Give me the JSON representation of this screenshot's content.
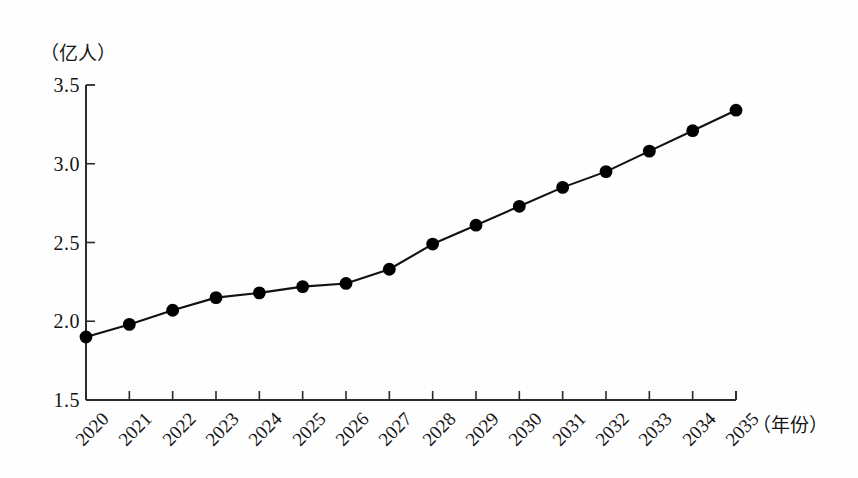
{
  "chart_data": {
    "type": "line",
    "title": "",
    "xlabel": "（年份）",
    "ylabel": "（亿人）",
    "categories": [
      "2020",
      "2021",
      "2022",
      "2023",
      "2024",
      "2025",
      "2026",
      "2027",
      "2028",
      "2029",
      "2030",
      "2031",
      "2032",
      "2033",
      "2034",
      "2035"
    ],
    "values": [
      1.9,
      1.98,
      2.07,
      2.15,
      2.18,
      2.22,
      2.24,
      2.33,
      2.49,
      2.61,
      2.73,
      2.85,
      2.95,
      3.08,
      3.21,
      3.34
    ],
    "series": [
      {
        "name": "人口",
        "values": [
          1.9,
          1.98,
          2.07,
          2.15,
          2.18,
          2.22,
          2.24,
          2.33,
          2.49,
          2.61,
          2.73,
          2.85,
          2.95,
          3.08,
          3.21,
          3.34
        ]
      }
    ],
    "ylim": [
      1.5,
      3.5
    ],
    "yticks": [
      1.5,
      2.0,
      2.5,
      3.0,
      3.5
    ],
    "ytick_labels": [
      "1.5",
      "2.0",
      "2.5",
      "3.0",
      "3.5"
    ],
    "grid": false,
    "legend": false,
    "legend_position": "none",
    "marker": "filled-circle",
    "line_color": "#111111",
    "marker_color": "#000000",
    "background_color": "#fefefe",
    "axis_color": "#2b2b2b"
  },
  "axes": {
    "y_unit_caption": "（亿人）",
    "x_unit_caption": "（年份）"
  }
}
